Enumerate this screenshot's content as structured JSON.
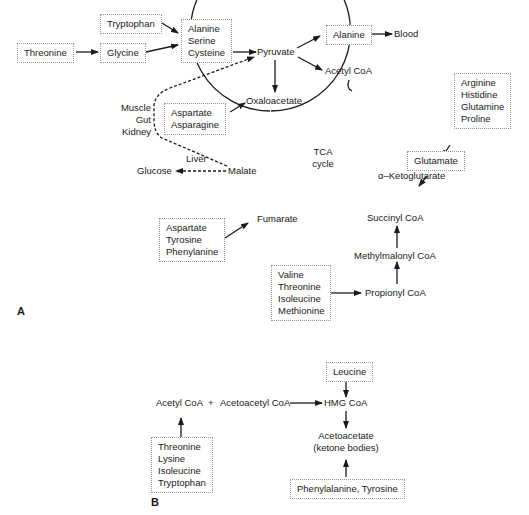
{
  "panel_a": {
    "label": "A",
    "boxes": {
      "tryptophan": [
        "Tryptophan"
      ],
      "threonine": [
        "Threonine"
      ],
      "glycine": [
        "Glycine"
      ],
      "ala_ser_cys": [
        "Alanine",
        "Serine",
        "Cysteine"
      ],
      "alanine": [
        "Alanine"
      ],
      "asp_asn": [
        "Aspartate",
        "Asparagine"
      ],
      "arg_his_gln_pro": [
        "Arginine",
        "Histidine",
        "Glutamine",
        "Proline"
      ],
      "glutamate": [
        "Glutamate"
      ],
      "asp_tyr_phe": [
        "Aspartate",
        "Tyrosine",
        "Phenylanine"
      ],
      "val_thr_ile_met": [
        "Valine",
        "Threonine",
        "Isoleucine",
        "Methionine"
      ]
    },
    "nodes": {
      "pyruvate": "Pyruvate",
      "blood": "Blood",
      "acetyl_coa": "Acetyl CoA",
      "oxaloacetate": "Oxaloacetate",
      "malate": "Malate",
      "glucose": "Glucose",
      "liver": "Liver",
      "fumarate": "Fumarate",
      "alpha_ketoglutarate": "α–Ketoglutarate",
      "succinyl_coa": "Succinyl CoA",
      "methylmalonyl_coa": "Methylmalonyl CoA",
      "propionyl_coa": "Propionyl CoA",
      "tissues": [
        "Muscle",
        "Gut",
        "Kidney"
      ],
      "tca_cycle": [
        "TCA",
        "cycle"
      ]
    }
  },
  "panel_b": {
    "label": "B",
    "nodes": {
      "acetyl_coa": "Acetyl CoA",
      "plus": "+",
      "acetoacetyl_coa": "Acetoacetyl CoA",
      "hmg_coa": "HMG CoA",
      "acetoacetate": [
        "Acetoacetate",
        "(ketone bodies)"
      ]
    },
    "boxes": {
      "leucine": [
        "Leucine"
      ],
      "thr_lys_ile_trp": [
        "Threonine",
        "Lysine",
        "Isoleucine",
        "Tryptophan"
      ],
      "phe_tyr": [
        "Phenylalanine, Tyrosine"
      ]
    }
  }
}
